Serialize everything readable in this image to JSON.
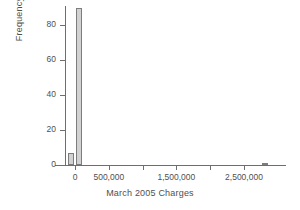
{
  "chart_data": {
    "type": "bar",
    "title": "",
    "xlabel": "March 2005 Charges",
    "ylabel": "Frequency",
    "xlim": [
      -250000,
      3000000
    ],
    "ylim": [
      0,
      93
    ],
    "grid": false,
    "legend": null,
    "xticks": [
      {
        "value": 0,
        "label": "0",
        "labeled": true
      },
      {
        "value": 500000,
        "label": "500,000",
        "labeled": true
      },
      {
        "value": 1000000,
        "label": "",
        "labeled": false
      },
      {
        "value": 1500000,
        "label": "1,500,000",
        "labeled": true
      },
      {
        "value": 2000000,
        "label": "",
        "labeled": false
      },
      {
        "value": 2500000,
        "label": "2,500,000",
        "labeled": true
      }
    ],
    "yticks": [
      {
        "value": 0,
        "label": "0"
      },
      {
        "value": 20,
        "label": "20"
      },
      {
        "value": 40,
        "label": "40"
      },
      {
        "value": 60,
        "label": "60"
      },
      {
        "value": 80,
        "label": "80"
      }
    ],
    "bars": [
      {
        "x_left": -110000,
        "x_right": -10000,
        "value": 7,
        "label": "bin-negative-near-zero"
      },
      {
        "x_left": 10000,
        "x_right": 110000,
        "value": 90,
        "label": "bin-zero-to-small"
      },
      {
        "x_left": 2760000,
        "x_right": 2860000,
        "value": 1,
        "label": "bin-outlier-2-8-million"
      }
    ],
    "categories": [
      "-110,000 to -10,000",
      "10,000 to 110,000",
      "2,760,000 to 2,860,000"
    ],
    "values": [
      7,
      90,
      1
    ],
    "colors": {
      "bar_fill": "#d2d2d2",
      "bar_stroke": "#7d7d7d",
      "axis": "#6e6e6e",
      "text": "#4f4f4f",
      "background": "#ffffff"
    }
  }
}
